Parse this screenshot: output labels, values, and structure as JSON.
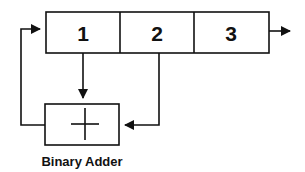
{
  "diagram": {
    "register": {
      "cells": [
        {
          "label": "1"
        },
        {
          "label": "2"
        },
        {
          "label": "3"
        }
      ]
    },
    "adder": {
      "symbol": "plus-icon",
      "caption": "Binary Adder"
    },
    "colors": {
      "stroke": "#111111",
      "background": "#ffffff"
    }
  }
}
